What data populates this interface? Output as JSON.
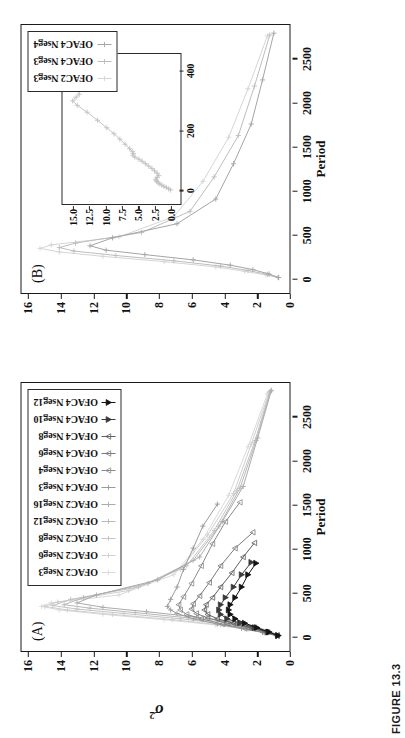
{
  "figure": {
    "caption": "FIGURE 13.3",
    "panel_a_letter": "(A)",
    "panel_b_letter": "(B)"
  },
  "chart_data": [
    {
      "id": "panel-a",
      "type": "line",
      "title": "(A)",
      "xlabel": "Period",
      "ylabel": "σ²",
      "xlim": [
        -120,
        2850
      ],
      "ylim": [
        0,
        16
      ],
      "xticks": [
        0,
        500,
        1000,
        1500,
        2000,
        2500
      ],
      "xticklabels": [
        "0",
        "500",
        "1000",
        "1500",
        "2000",
        "2500"
      ],
      "yticks": [
        0,
        2,
        4,
        6,
        8,
        10,
        12,
        14,
        16
      ],
      "yticklabels": [
        "0",
        "2",
        "4",
        "6",
        "8",
        "10",
        "12",
        "14",
        "16"
      ],
      "grid": false,
      "legend_position": "upper right",
      "series": [
        {
          "name": "OFAC2 Nseg3",
          "color": "#d9d9d9",
          "marker": "plus",
          "x": [
            10,
            40,
            80,
            130,
            190,
            250,
            300,
            340,
            380,
            470,
            700,
            1100,
            1600,
            2150,
            2750
          ],
          "y": [
            0.35,
            1.1,
            2.4,
            4.2,
            7.4,
            11.2,
            13.9,
            15.0,
            14.4,
            10.2,
            6.8,
            5.0,
            3.4,
            2.2,
            1.0
          ]
        },
        {
          "name": "OFAC2 Nseg6",
          "color": "#cfcfcf",
          "marker": "plus",
          "x": [
            10,
            40,
            80,
            130,
            190,
            250,
            300,
            340,
            390,
            520,
            760,
            1150,
            1620,
            2180,
            2760
          ],
          "y": [
            0.3,
            1.0,
            2.2,
            3.9,
            6.9,
            10.6,
            13.4,
            14.8,
            14.0,
            9.6,
            6.4,
            4.7,
            3.1,
            2.0,
            0.9
          ]
        },
        {
          "name": "OFAC2 Nseg8",
          "color": "#c4c4c4",
          "marker": "plus",
          "x": [
            10,
            45,
            90,
            140,
            200,
            260,
            310,
            350,
            420,
            560,
            800,
            1200,
            1650,
            2200,
            2770
          ],
          "y": [
            0.28,
            0.95,
            2.0,
            3.6,
            6.4,
            9.9,
            12.8,
            14.3,
            13.2,
            9.0,
            6.0,
            4.3,
            2.9,
            1.8,
            0.85
          ]
        },
        {
          "name": "OFAC2 Nseg12",
          "color": "#b8b8b8",
          "marker": "plus",
          "x": [
            10,
            50,
            100,
            150,
            210,
            270,
            320,
            360,
            440,
            600,
            860,
            1250,
            1680,
            2220,
            2780
          ],
          "y": [
            0.26,
            0.9,
            1.85,
            3.3,
            5.9,
            9.2,
            12.0,
            13.6,
            12.4,
            8.4,
            5.6,
            4.0,
            2.7,
            1.7,
            0.8
          ]
        },
        {
          "name": "OFAC2 Nseg16",
          "color": "#ababab",
          "marker": "plus",
          "x": [
            10,
            55,
            110,
            160,
            220,
            280,
            330,
            380,
            470,
            640,
            900,
            1300,
            1700,
            2250,
            2790
          ],
          "y": [
            0.25,
            0.85,
            1.7,
            3.0,
            5.4,
            8.5,
            11.2,
            12.8,
            11.6,
            7.8,
            5.2,
            3.8,
            2.5,
            1.6,
            0.75
          ]
        },
        {
          "name": "OFAC4 Nseg3",
          "color": "#9a9a9a",
          "marker": "plus",
          "x": [
            10,
            45,
            90,
            140,
            200,
            260,
            300,
            340,
            420,
            560,
            760,
            1000,
            1250,
            1500
          ],
          "y": [
            0.45,
            1.3,
            2.6,
            4.1,
            5.6,
            6.6,
            7.0,
            7.2,
            7.0,
            6.6,
            6.2,
            5.6,
            5.0,
            4.1
          ]
        },
        {
          "name": "OFAC4 Nseg4",
          "color": "#8a8a8a",
          "marker": "triangle",
          "x": [
            10,
            45,
            90,
            140,
            200,
            250,
            300,
            360,
            450,
            600,
            800,
            1050,
            1300,
            1520
          ],
          "y": [
            0.42,
            1.25,
            2.4,
            3.8,
            5.1,
            6.0,
            6.4,
            6.5,
            6.2,
            5.7,
            5.1,
            4.4,
            3.6,
            2.7
          ]
        },
        {
          "name": "OFAC4 Nseg6",
          "color": "#7a7a7a",
          "marker": "triangle",
          "x": [
            10,
            50,
            100,
            150,
            210,
            260,
            310,
            370,
            460,
            610,
            800,
            1000,
            1180
          ],
          "y": [
            0.4,
            1.15,
            2.2,
            3.5,
            4.7,
            5.4,
            5.7,
            5.6,
            5.2,
            4.6,
            3.9,
            3.0,
            1.9
          ]
        },
        {
          "name": "OFAC4 Nseg8",
          "color": "#5f5f5f",
          "marker": "triangle",
          "x": [
            10,
            50,
            100,
            150,
            200,
            250,
            300,
            360,
            440,
            560,
            720,
            900,
            1060
          ],
          "y": [
            0.38,
            1.05,
            2.0,
            3.1,
            4.1,
            4.7,
            4.9,
            4.8,
            4.4,
            3.9,
            3.2,
            2.5,
            1.8
          ]
        },
        {
          "name": "OFAC4 Nseg10",
          "color": "#3a3a3a",
          "marker": "triangle-filled",
          "x": [
            10,
            50,
            100,
            150,
            200,
            250,
            300,
            360,
            440,
            560,
            700,
            840
          ],
          "y": [
            0.35,
            0.95,
            1.8,
            2.7,
            3.5,
            3.9,
            4.0,
            3.9,
            3.6,
            3.1,
            2.6,
            2.0
          ]
        },
        {
          "name": "OFAC4 Nseg12",
          "color": "#141414",
          "marker": "triangle-filled",
          "x": [
            10,
            50,
            100,
            150,
            200,
            250,
            300,
            360,
            440,
            560,
            700,
            830
          ],
          "y": [
            0.33,
            0.9,
            1.65,
            2.4,
            3.0,
            3.3,
            3.4,
            3.3,
            3.0,
            2.6,
            2.2,
            1.7
          ]
        }
      ],
      "legend_labels": [
        "OFAC2 Nseg3",
        "OFAC2 Nseg6",
        "OFAC2 Nseg8",
        "OFAC2 Nseg12",
        "OFAC2 Nseg16",
        "OFAC4 Nseg3",
        "OFAC4 Nseg4",
        "OFAC4 Nseg6",
        "OFAC4 Nseg8",
        "OFAC4 Nseg10",
        "OFAC4 Nseg12"
      ]
    },
    {
      "id": "panel-b",
      "type": "line",
      "title": "(B)",
      "xlabel": "Period",
      "ylabel": "",
      "xlim": [
        -120,
        2850
      ],
      "ylim": [
        0,
        16
      ],
      "xticks": [
        0,
        500,
        1000,
        1500,
        2000,
        2500
      ],
      "xticklabels": [
        "0",
        "500",
        "1000",
        "1500",
        "2000",
        "2500"
      ],
      "yticks": [
        0,
        2,
        4,
        6,
        8,
        10,
        12,
        14,
        16
      ],
      "yticklabels": [
        "0",
        "2",
        "4",
        "6",
        "8",
        "10",
        "12",
        "14",
        "16"
      ],
      "grid": false,
      "legend_position": "upper right",
      "series": [
        {
          "name": "OFAC2 Nseg3",
          "color": "#d5d5d5",
          "marker": "plus",
          "x": [
            10,
            40,
            80,
            130,
            190,
            250,
            300,
            340,
            380,
            470,
            700,
            1100,
            1600,
            2150,
            2750
          ],
          "y": [
            0.35,
            1.1,
            2.4,
            4.2,
            7.4,
            11.2,
            13.9,
            15.1,
            14.4,
            10.2,
            6.8,
            5.0,
            3.4,
            2.2,
            1.0
          ]
        },
        {
          "name": "OFAC4 Nseg3",
          "color": "#bdbdbd",
          "marker": "plus",
          "x": [
            10,
            45,
            90,
            140,
            200,
            260,
            310,
            350,
            400,
            520,
            760,
            1150,
            1620,
            2180,
            2760
          ],
          "y": [
            0.32,
            1.0,
            2.2,
            3.9,
            6.8,
            10.4,
            13.0,
            13.9,
            12.9,
            8.8,
            5.8,
            4.3,
            2.8,
            1.8,
            0.85
          ]
        },
        {
          "name": "OFAC4 Nseg4",
          "color": "#a5a5a5",
          "marker": "plus",
          "x": [
            10,
            50,
            100,
            150,
            210,
            270,
            320,
            370,
            460,
            620,
            900,
            1300,
            1750,
            2250,
            2780
          ],
          "y": [
            0.3,
            0.9,
            1.9,
            3.3,
            5.6,
            8.6,
            11.0,
            12.0,
            10.6,
            6.6,
            4.2,
            3.1,
            2.0,
            1.3,
            0.6
          ]
        }
      ],
      "legend_labels": [
        "OFAC2 Nseg3",
        "OFAC4 Nseg3",
        "OFAC4 Nseg4"
      ],
      "inset": {
        "type": "line",
        "xlim": [
          -35,
          440
        ],
        "ylim": [
          -0.6,
          16.2
        ],
        "xticks": [
          0,
          200,
          400
        ],
        "xticklabels": [
          "0",
          "200",
          "400"
        ],
        "yticks": [
          0.0,
          2.5,
          5.0,
          7.5,
          10.0,
          12.5,
          15.0
        ],
        "yticklabels": [
          "0.0",
          "2.5",
          "5.0",
          "7.5",
          "10.0",
          "12.5",
          "15.0"
        ],
        "grid": false,
        "series": [
          {
            "name": "OFAC2 Nseg3",
            "color": "#c2c2c2",
            "marker": "plus",
            "x": [
              2,
              6,
              10,
              14,
              18,
              22,
              26,
              30,
              34,
              38,
              44,
              50,
              58,
              66,
              74,
              82,
              90,
              98,
              105,
              112,
              118,
              124,
              130,
              140,
              155,
              172,
              190,
              210,
              235,
              262,
              285,
              300,
              312,
              322,
              340,
              365,
              395,
              415
            ],
            "y": [
              0.15,
              0.45,
              0.8,
              1.15,
              1.5,
              1.8,
              2.05,
              2.25,
              2.35,
              2.4,
              2.2,
              1.95,
              2.2,
              2.6,
              3.0,
              3.5,
              4.0,
              4.5,
              5.0,
              5.6,
              5.9,
              5.85,
              5.95,
              6.4,
              7.1,
              7.9,
              8.8,
              9.9,
              11.3,
              12.9,
              14.4,
              15.1,
              14.6,
              14.1,
              14.3,
              14.0,
              13.1,
              12.2
            ]
          }
        ]
      }
    }
  ]
}
